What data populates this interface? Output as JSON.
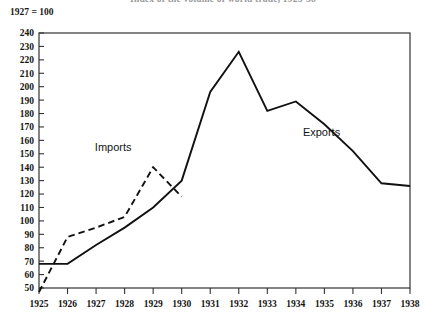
{
  "figure": {
    "title": "Index of the volume of world trade, 1925-38",
    "index_note": "1927 = 100",
    "series_labels": {
      "imports": "Imports",
      "exports": "Exports"
    }
  },
  "chart_data": {
    "type": "line",
    "title": "Index of the volume of world trade, 1925-38",
    "subtitle": "1927 = 100",
    "xlabel": "",
    "ylabel": "",
    "grid": false,
    "legend_position": "inline-annotation",
    "x": [
      1925,
      1926,
      1927,
      1928,
      1929,
      1930,
      1931,
      1932,
      1933,
      1934,
      1935,
      1936,
      1937,
      1938
    ],
    "xticklabels": [
      "1925",
      "1926",
      "1927",
      "1928",
      "1929",
      "1930",
      "1931",
      "1932",
      "1933",
      "1934",
      "1935",
      "1936",
      "1937",
      "1938"
    ],
    "xlim": [
      1925,
      1938
    ],
    "ylim": [
      50,
      240
    ],
    "yticks": [
      50,
      60,
      70,
      80,
      90,
      100,
      110,
      120,
      130,
      140,
      150,
      160,
      170,
      180,
      190,
      200,
      210,
      220,
      230,
      240
    ],
    "yticklabels": [
      "50",
      "60",
      "70",
      "80",
      "90",
      "100",
      "110",
      "120",
      "130",
      "140",
      "150",
      "160",
      "170",
      "180",
      "190",
      "200",
      "210",
      "220",
      "230",
      "240"
    ],
    "series": [
      {
        "name": "Exports",
        "style": "solid",
        "color": "#111111",
        "x": [
          1925,
          1926,
          1927,
          1928,
          1929,
          1930,
          1931,
          1932,
          1933,
          1934,
          1935,
          1936,
          1937,
          1938
        ],
        "values": [
          68,
          68,
          82,
          95,
          110,
          130,
          196,
          226,
          182,
          189,
          172,
          152,
          128,
          126
        ]
      },
      {
        "name": "Imports",
        "style": "dashed",
        "color": "#111111",
        "x": [
          1925,
          1926,
          1927,
          1928,
          1929,
          1930
        ],
        "values": [
          47,
          88,
          95,
          103,
          140,
          118
        ]
      }
    ],
    "annotations": [
      {
        "text": "Imports",
        "x": 1927.6,
        "y": 152
      },
      {
        "text": "Exports",
        "x": 1934.9,
        "y": 163
      }
    ]
  }
}
